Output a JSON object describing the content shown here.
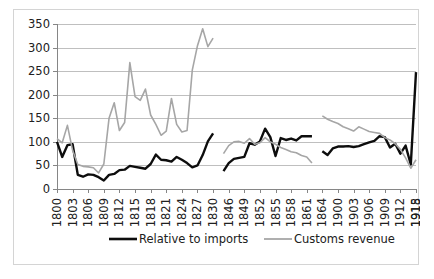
{
  "chart_data": {
    "type": "line",
    "title": "",
    "xlabel": "",
    "ylabel": "",
    "ylim": [
      0,
      350
    ],
    "ytick_step": 50,
    "yticks": [
      0,
      50,
      100,
      150,
      200,
      250,
      300,
      350
    ],
    "grid": true,
    "legend_position": "bottom",
    "x_tick_labels": [
      "1800",
      "1803",
      "1806",
      "1809",
      "1812",
      "1815",
      "1818",
      "1821",
      "1824",
      "1827",
      "1830",
      "1846",
      "1849",
      "1852",
      "1855",
      "1858",
      "1861",
      "1864",
      "1900",
      "1903",
      "1906",
      "1909",
      "1912",
      "1915",
      "1918"
    ],
    "x_tick_every": 3,
    "x": [
      1800,
      1801,
      1802,
      1803,
      1804,
      1805,
      1806,
      1807,
      1808,
      1809,
      1810,
      1811,
      1812,
      1813,
      1814,
      1815,
      1816,
      1817,
      1818,
      1819,
      1820,
      1821,
      1822,
      1823,
      1824,
      1825,
      1826,
      1827,
      1828,
      1829,
      1830,
      1846,
      1847,
      1848,
      1849,
      1850,
      1851,
      1852,
      1853,
      1854,
      1855,
      1856,
      1857,
      1858,
      1859,
      1860,
      1861,
      1862,
      1863,
      1864,
      1900,
      1901,
      1902,
      1903,
      1904,
      1905,
      1906,
      1907,
      1908,
      1909,
      1910,
      1911,
      1912,
      1913,
      1914,
      1915,
      1916,
      1917,
      1918,
      1919
    ],
    "series": [
      {
        "name": "Relative to imports",
        "color": "#0d0d0d",
        "width": 2.4,
        "values": [
          100,
          68,
          93,
          95,
          30,
          26,
          31,
          30,
          25,
          18,
          30,
          32,
          40,
          41,
          49,
          47,
          45,
          43,
          53,
          73,
          62,
          61,
          58,
          68,
          62,
          55,
          46,
          50,
          72,
          101,
          118,
          null,
          38,
          55,
          64,
          66,
          68,
          97,
          94,
          101,
          128,
          110,
          70,
          108,
          104,
          107,
          103,
          112,
          112,
          112,
          null,
          80,
          72,
          86,
          90,
          90,
          91,
          89,
          91,
          95,
          99,
          102,
          112,
          110,
          88,
          96,
          75,
          92,
          52,
          248
        ]
      },
      {
        "name": "Customs revenue",
        "color": "#a6a6a6",
        "width": 1.6,
        "values": [
          107,
          98,
          135,
          82,
          52,
          48,
          47,
          45,
          34,
          53,
          150,
          183,
          124,
          141,
          268,
          196,
          188,
          212,
          157,
          137,
          114,
          123,
          192,
          137,
          121,
          124,
          252,
          304,
          340,
          302,
          320,
          null,
          75,
          92,
          100,
          101,
          97,
          107,
          95,
          98,
          109,
          100,
          95,
          88,
          84,
          79,
          77,
          71,
          68,
          55,
          null,
          155,
          148,
          143,
          139,
          132,
          128,
          123,
          132,
          127,
          122,
          120,
          118,
          109,
          104,
          96,
          84,
          66,
          44,
          62
        ]
      }
    ]
  },
  "legend": {
    "entries": [
      {
        "label": "Relative to imports",
        "color": "#0d0d0d",
        "width": 2.6
      },
      {
        "label": "Customs revenue",
        "color": "#a6a6a6",
        "width": 1.8
      }
    ]
  }
}
